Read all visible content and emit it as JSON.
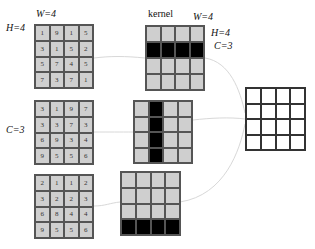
{
  "labels": {
    "input_w": "W=4",
    "input_h": "H=4",
    "channels": "C=3",
    "kernel_title": "kernel",
    "kernel_w": "W=4",
    "kernel_h": "H=4",
    "kernel_c": "C=3"
  },
  "inputs": [
    {
      "name": "channel-1",
      "values": [
        [
          1,
          9,
          1,
          5
        ],
        [
          3,
          1,
          5,
          2
        ],
        [
          5,
          7,
          4,
          5
        ],
        [
          7,
          3,
          7,
          1
        ]
      ]
    },
    {
      "name": "channel-2",
      "values": [
        [
          3,
          1,
          9,
          7
        ],
        [
          3,
          3,
          7,
          3
        ],
        [
          6,
          9,
          3,
          4
        ],
        [
          9,
          5,
          5,
          6
        ]
      ]
    },
    {
      "name": "channel-3",
      "values": [
        [
          2,
          1,
          1,
          2
        ],
        [
          3,
          2,
          2,
          3
        ],
        [
          6,
          8,
          4,
          4
        ],
        [
          9,
          5,
          5,
          6
        ]
      ]
    }
  ],
  "kernels": [
    {
      "name": "kernel-1",
      "highlight": "row",
      "index": 1
    },
    {
      "name": "kernel-2",
      "highlight": "column",
      "index": 1
    },
    {
      "name": "kernel-3",
      "highlight": "row",
      "index": 3
    }
  ],
  "output": {
    "rows": 4,
    "cols": 4
  },
  "colors": {
    "cell": "#cfcfcf",
    "highlight": "#000000",
    "connector": "#d8d8d8"
  }
}
